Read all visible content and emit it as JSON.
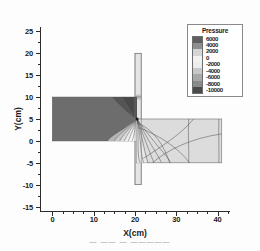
{
  "chart_data": {
    "type": "contour",
    "title": "",
    "xlabel": "X(cm)",
    "ylabel": "Y(cm)",
    "xlim": [
      -3,
      43
    ],
    "ylim": [
      -16,
      26
    ],
    "xticks": [
      0,
      10,
      20,
      30,
      40
    ],
    "yticks": [
      25,
      20,
      15,
      10,
      5,
      0,
      -5,
      -10,
      -15
    ],
    "xtick_labels": [
      "0",
      "10",
      "20",
      "30",
      "40"
    ],
    "ytick_labels": [
      "25",
      "20",
      "15",
      "10",
      "5",
      "0",
      "-5",
      "-10",
      "-15"
    ],
    "minor_tick_step": 2.5,
    "grid": false,
    "legend_position": "top-right",
    "legend_title": "Pressure",
    "legend_levels": [
      6000,
      4000,
      2000,
      0,
      -2000,
      -4000,
      -6000,
      -8000,
      -10000
    ],
    "legend_level_labels": [
      "6000",
      "4000",
      "2000",
      "0",
      "-2000",
      "-4000",
      "-6000",
      "-8000",
      "-10000"
    ],
    "legend_colors": [
      "#5f5f5f",
      "#8f8f8f",
      "#d5d5d5",
      "#f2f2f2",
      "#ededed",
      "#c8c8c8",
      "#a8a8a8",
      "#8a8a8a",
      "#4a4a4a"
    ],
    "regions": [
      {
        "name": "left-plate",
        "x_range": [
          0,
          20.4
        ],
        "y_range": [
          0,
          10
        ],
        "fill": "#6d6d6d",
        "description": "horizontal left plate, uniform high pressure"
      },
      {
        "name": "vertical-bar",
        "x_range": [
          20.0,
          21.5
        ],
        "y_range": [
          -10,
          20
        ],
        "fill": "#e4e4e4",
        "description": "vertical stiffener bar spanning above and below"
      },
      {
        "name": "right-plate",
        "x_range": [
          20.4,
          41
        ],
        "y_range": [
          -5,
          5
        ],
        "fill": "#dcdcdc",
        "description": "horizontal right plate with radiating contours"
      }
    ],
    "singularity_point": [
      20.5,
      5
    ]
  },
  "caption": {
    "text": "— —— — —————"
  }
}
